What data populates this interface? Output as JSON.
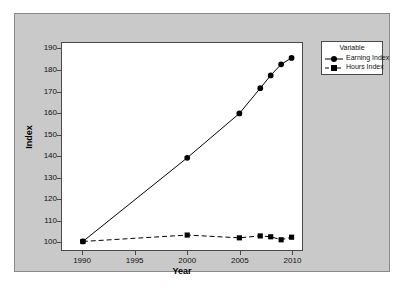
{
  "chart_data": {
    "type": "line",
    "title": "",
    "xlabel": "Year",
    "ylabel": "Index",
    "xlim": [
      1988,
      2011
    ],
    "ylim": [
      96,
      193
    ],
    "grid": false,
    "legend_position": "top-right",
    "legend_title": "Variable",
    "xticks": [
      1990,
      1995,
      2000,
      2005,
      2010
    ],
    "yticks": [
      100,
      110,
      120,
      130,
      140,
      150,
      160,
      170,
      180,
      190
    ],
    "series": [
      {
        "name": "Earning Index",
        "marker": "circle",
        "linestyle": "solid",
        "color": "#000000",
        "x": [
          1990,
          2000,
          2005,
          2007,
          2008,
          2009,
          2010
        ],
        "values": [
          100.0,
          139.2,
          160.0,
          171.8,
          177.8,
          183.0,
          186.0
        ]
      },
      {
        "name": "Hours Index",
        "marker": "square",
        "linestyle": "dashed",
        "color": "#000000",
        "x": [
          1990,
          2000,
          2005,
          2007,
          2008,
          2009,
          2010
        ],
        "values": [
          100.0,
          103.0,
          101.7,
          102.6,
          102.2,
          100.8,
          102.0
        ]
      }
    ]
  },
  "legend": {
    "title": "Variable",
    "items": [
      {
        "label": "Earning Index",
        "marker": "circle",
        "linestyle": "solid"
      },
      {
        "label": "Hours Index",
        "marker": "square",
        "linestyle": "dashed"
      }
    ]
  },
  "axes": {
    "x_title": "Year",
    "y_title": "Index"
  },
  "colors": {
    "figure_background": "#c9c9c9",
    "plot_background": "#ffffff",
    "axis": "#4a4a4a",
    "series": "#000000",
    "text": "#111111"
  }
}
